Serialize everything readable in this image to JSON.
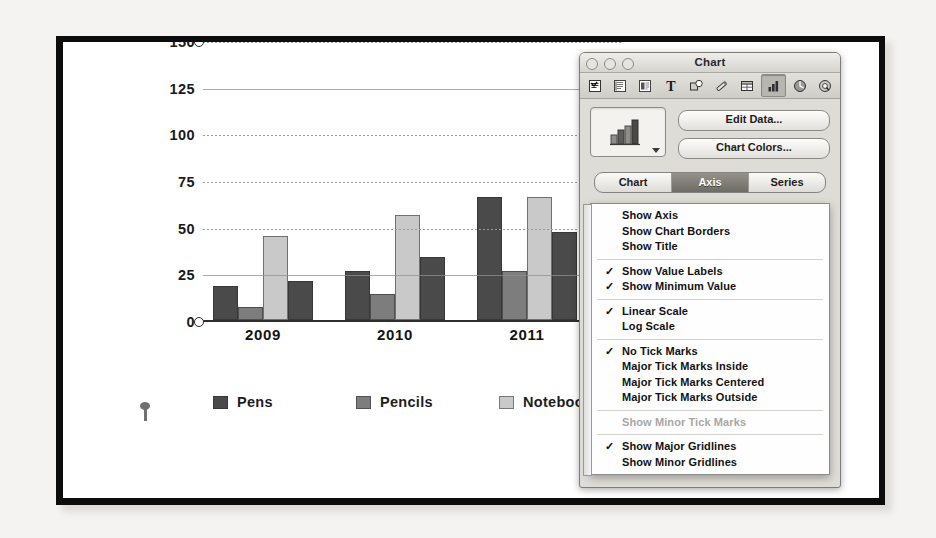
{
  "chart_data": {
    "type": "bar",
    "title": "",
    "xlabel": "",
    "ylabel": "",
    "categories": [
      "2009",
      "2010",
      "2011"
    ],
    "ylim": [
      0,
      150
    ],
    "yticks": [
      0,
      25,
      50,
      75,
      100,
      125,
      150
    ],
    "grid": true,
    "legend_position": "bottom",
    "series": [
      {
        "name": "Pens",
        "color": "#4a4a4a",
        "values": [
          18,
          26,
          66
        ]
      },
      {
        "name": "Pencils",
        "color": "#7d7d7d",
        "values": [
          7,
          14,
          26
        ]
      },
      {
        "name": "Notebooks",
        "color": "#c9c9c9",
        "values": [
          45,
          56,
          66
        ]
      },
      {
        "name": "",
        "color": "#4a4a4a",
        "values": [
          21,
          34,
          47
        ]
      }
    ],
    "overflow_bar": {
      "name": "",
      "color": "#4a4a4a",
      "value": 80
    }
  },
  "inspector": {
    "window_title": "Chart",
    "traffic_lights": [
      "close-light",
      "minimize-light",
      "zoom-light"
    ],
    "toolbar_icons": [
      "document-inspector-icon",
      "layout-inspector-icon",
      "wrap-inspector-icon",
      "text-inspector-icon",
      "graphic-inspector-icon",
      "metrics-inspector-icon",
      "table-inspector-icon",
      "chart-inspector-icon",
      "hyperlink-inspector-icon",
      "quicktime-inspector-icon"
    ],
    "chart_type_icon": "bar-chart-icon",
    "buttons": {
      "edit_data": "Edit Data...",
      "chart_colors": "Chart Colors..."
    },
    "tabs": [
      {
        "label": "Chart",
        "selected": false
      },
      {
        "label": "Axis",
        "selected": true
      },
      {
        "label": "Series",
        "selected": false
      }
    ],
    "axis_section_label": "Value Axis (Y)",
    "axis_options_combo": "Choose Axis Options",
    "menu_groups": [
      {
        "items": [
          {
            "label": "Show Axis",
            "checked": false,
            "disabled": false
          },
          {
            "label": "Show Chart Borders",
            "checked": false,
            "disabled": false
          },
          {
            "label": "Show Title",
            "checked": false,
            "disabled": false
          }
        ]
      },
      {
        "items": [
          {
            "label": "Show Value Labels",
            "checked": true,
            "disabled": false
          },
          {
            "label": "Show Minimum Value",
            "checked": true,
            "disabled": false
          }
        ]
      },
      {
        "items": [
          {
            "label": "Linear Scale",
            "checked": true,
            "disabled": false
          },
          {
            "label": "Log Scale",
            "checked": false,
            "disabled": false
          }
        ]
      },
      {
        "items": [
          {
            "label": "No Tick Marks",
            "checked": true,
            "disabled": false
          },
          {
            "label": "Major Tick Marks Inside",
            "checked": false,
            "disabled": false
          },
          {
            "label": "Major Tick Marks Centered",
            "checked": false,
            "disabled": false
          },
          {
            "label": "Major Tick Marks Outside",
            "checked": false,
            "disabled": false
          }
        ]
      },
      {
        "items": [
          {
            "label": "Show Minor Tick Marks",
            "checked": false,
            "disabled": true
          }
        ]
      },
      {
        "items": [
          {
            "label": "Show Major Gridlines",
            "checked": true,
            "disabled": false
          },
          {
            "label": "Show Minor Gridlines",
            "checked": false,
            "disabled": false
          }
        ]
      }
    ],
    "check_glyph": "✓"
  },
  "page": {
    "pin_marker": "pin-marker-icon"
  }
}
